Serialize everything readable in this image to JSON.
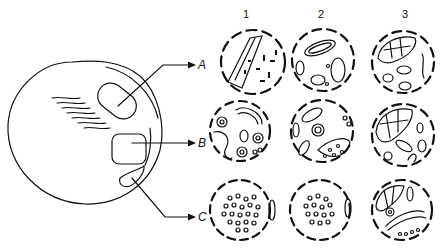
{
  "figure": {
    "type": "anatomical schematic with histology panels",
    "overview": {
      "description": "Outline of an oval organ with three marked regions A, B, C and arrows pointing to histological sections"
    },
    "region_labels": [
      "A",
      "B",
      "C"
    ],
    "column_labels": [
      "1",
      "2",
      "3"
    ],
    "panels": [
      {
        "row": "A",
        "col": "1",
        "content": "tubular epithelium band with scattered dark nuclei"
      },
      {
        "row": "A",
        "col": "2",
        "content": "elongated and round tubule cross-sections"
      },
      {
        "row": "A",
        "col": "3",
        "content": "large lobulated structure with tubules"
      },
      {
        "row": "B",
        "col": "1",
        "content": "convoluted tubules and round tubule sections"
      },
      {
        "row": "B",
        "col": "2",
        "content": "tubules with a crescent region containing round cells"
      },
      {
        "row": "B",
        "col": "3",
        "content": "lobulated mass with convoluted tubules"
      },
      {
        "row": "C",
        "col": "1",
        "content": "densely packed round cells within capsule"
      },
      {
        "row": "C",
        "col": "2",
        "content": "densely packed round cells within capsule"
      },
      {
        "row": "C",
        "col": "3",
        "content": "lobulated region with elongated tubule and round cells"
      }
    ],
    "colors": {
      "ink": "#111111",
      "background": "#ffffff"
    }
  }
}
